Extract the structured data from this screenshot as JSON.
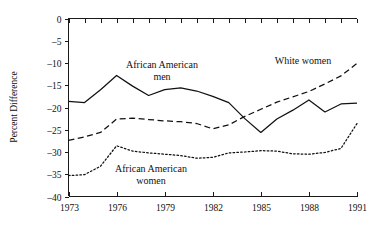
{
  "chart_data": {
    "type": "line",
    "title": "",
    "xlabel": "",
    "ylabel": "Percent Difference",
    "xlim": [
      1973,
      1991
    ],
    "ylim": [
      -40,
      0
    ],
    "yticks": [
      0,
      -5,
      -10,
      -15,
      -20,
      -25,
      -30,
      -35,
      -40
    ],
    "ytick_labels": [
      "0",
      "–5",
      "–10",
      "–15",
      "–20",
      "–25",
      "–30",
      "–35",
      "–40"
    ],
    "xticks": [
      1973,
      1976,
      1979,
      1982,
      1985,
      1988,
      1991
    ],
    "xtick_labels": [
      "1973",
      "1976",
      "1979",
      "1982",
      "1985",
      "1988",
      "1991"
    ],
    "xminor_ticks": [
      1974,
      1975,
      1977,
      1978,
      1980,
      1981,
      1983,
      1984,
      1986,
      1987,
      1989,
      1990
    ],
    "grid": false,
    "legend_position": "inline-annotations",
    "x": [
      1973,
      1974,
      1975,
      1976,
      1977,
      1978,
      1979,
      1980,
      1981,
      1982,
      1983,
      1984,
      1985,
      1986,
      1987,
      1988,
      1989,
      1990,
      1991
    ],
    "series": [
      {
        "name": "African American men",
        "style": "solid",
        "color": "#111111",
        "label_text": "African American\nmen",
        "label_line_1": "African American",
        "label_line_2": "men",
        "values": [
          -18.6,
          -18.9,
          -16.0,
          -12.8,
          -15.2,
          -17.3,
          -16.0,
          -15.6,
          -16.3,
          -17.5,
          -18.9,
          -22.5,
          -25.6,
          -22.6,
          -20.6,
          -18.3,
          -21.0,
          -19.2,
          -19.0
        ]
      },
      {
        "name": "White women",
        "style": "dashed",
        "color": "#111111",
        "label_text": "White women",
        "label_line_1": "White women",
        "label_line_2": "",
        "values": [
          -27.4,
          -26.6,
          -25.6,
          -22.6,
          -22.4,
          -22.7,
          -23.0,
          -23.2,
          -23.6,
          -24.8,
          -23.9,
          -22.0,
          -20.4,
          -18.8,
          -17.6,
          -16.4,
          -14.7,
          -12.9,
          -10.1
        ]
      },
      {
        "name": "African American women",
        "style": "dotted",
        "color": "#111111",
        "label_text": "African American\nwomen",
        "label_line_1": "African American",
        "label_line_2": "women",
        "values": [
          -35.3,
          -35.1,
          -33.2,
          -28.6,
          -29.8,
          -30.2,
          -30.5,
          -30.8,
          -31.4,
          -31.2,
          -30.2,
          -30.0,
          -29.7,
          -29.8,
          -30.4,
          -30.5,
          -30.1,
          -29.2,
          -23.6
        ]
      }
    ]
  },
  "annotations": {
    "african_american_men": {
      "line1": "African American",
      "line2": "men"
    },
    "white_women": {
      "line1": "White women"
    },
    "african_american_women": {
      "line1": "African American",
      "line2": "women"
    }
  },
  "axes": {
    "y_axis_title": "Percent Difference"
  }
}
